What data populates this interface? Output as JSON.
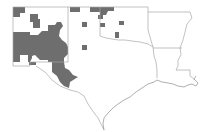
{
  "map": {
    "title": "",
    "region": "South-central United States",
    "states": [
      "New Mexico",
      "Texas",
      "Oklahoma",
      "Arkansas",
      "Louisiana"
    ],
    "colors": {
      "background": "#ffffff",
      "shaded_county": "#6e6e6e",
      "state_border": "#a8a8a8",
      "coastline": "#8c8c8c"
    },
    "legend": null,
    "shaded_areas": [
      {
        "id": "nm-north-west",
        "label": "NW New Mexico counties"
      },
      {
        "id": "nm-north-central",
        "label": "N-central New Mexico counties"
      },
      {
        "id": "nm-south-central",
        "label": "S-central New Mexico counties"
      },
      {
        "id": "tx-trans-pecos",
        "label": "Trans-Pecos Texas counties"
      },
      {
        "id": "tx-panhandle-north",
        "label": "N Panhandle Texas counties"
      },
      {
        "id": "tx-panhandle-isolated",
        "label": "Isolated Panhandle county"
      },
      {
        "id": "tx-south-plains-isolated",
        "label": "Isolated South Plains county"
      },
      {
        "id": "ok-panhandle",
        "label": "Oklahoma Panhandle counties"
      },
      {
        "id": "ok-west-isolated",
        "label": "Isolated W Oklahoma county"
      },
      {
        "id": "ok-southwest",
        "label": "SW Oklahoma county"
      },
      {
        "id": "tx-rolling-plains-isolated",
        "label": "Isolated Rolling Plains county"
      }
    ]
  }
}
